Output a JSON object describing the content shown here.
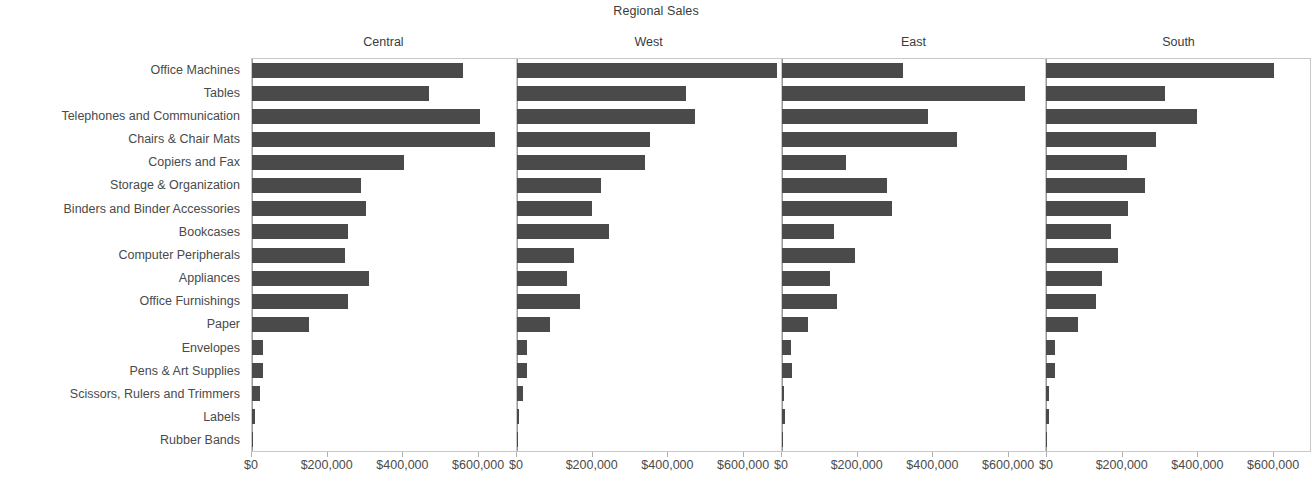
{
  "chart": {
    "title": "Regional Sales"
  },
  "chart_data": {
    "type": "bar",
    "orientation": "horizontal",
    "title": "Regional Sales",
    "xlabel": "",
    "ylabel": "",
    "xlim": [
      0,
      700000
    ],
    "xticks": [
      0,
      200000,
      400000,
      600000
    ],
    "xtick_labels": [
      "$0",
      "$200,000",
      "$400,000",
      "$600,000"
    ],
    "tick_format": "currency-usd-thousands-separated",
    "grid": false,
    "legend": "none",
    "panel_layout": "small-multiples-columns",
    "panels": [
      "Central",
      "West",
      "East",
      "South"
    ],
    "categories": [
      "Office Machines",
      "Tables",
      "Telephones and Communication",
      "Chairs & Chair Mats",
      "Copiers and Fax",
      "Storage & Organization",
      "Binders and Binder Accessories",
      "Bookcases",
      "Computer Peripherals",
      "Appliances",
      "Office Furnishings",
      "Paper",
      "Envelopes",
      "Pens & Art Supplies",
      "Scissors, Rulers and Trimmers",
      "Labels",
      "Rubber Bands"
    ],
    "series": [
      {
        "name": "Central",
        "values": [
          560000,
          471000,
          605000,
          645000,
          404000,
          290000,
          302000,
          255000,
          248000,
          310000,
          254000,
          152000,
          30000,
          28000,
          22000,
          9000,
          2000
        ]
      },
      {
        "name": "West",
        "values": [
          690000,
          450000,
          473000,
          353000,
          340000,
          224000,
          199000,
          246000,
          153000,
          134000,
          168000,
          88000,
          28000,
          26000,
          16000,
          6000,
          2000
        ]
      },
      {
        "name": "East",
        "values": [
          323000,
          645000,
          388000,
          466000,
          172000,
          281000,
          292000,
          140000,
          196000,
          130000,
          147000,
          70000,
          26000,
          29000,
          7000,
          9000,
          2000
        ]
      },
      {
        "name": "South",
        "values": [
          605000,
          315000,
          400000,
          291000,
          214000,
          262000,
          218000,
          172000,
          190000,
          148000,
          131000,
          84000,
          22000,
          24000,
          7000,
          8000,
          1500
        ]
      }
    ],
    "colors": {
      "bar": "#4a4a4a",
      "axis": "#c8c8c8",
      "text": "#4a4a4a",
      "background": "#ffffff"
    }
  }
}
